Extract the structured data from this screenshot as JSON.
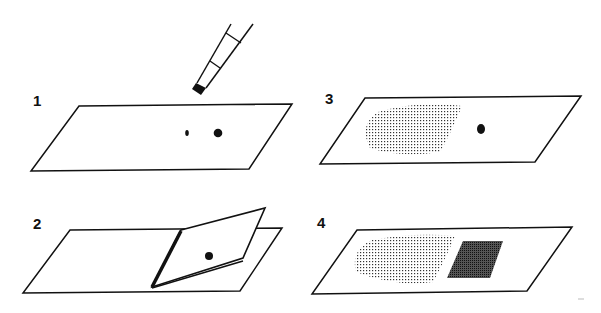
{
  "figure": {
    "panels": [
      {
        "label": "1",
        "description": "Slide with two drops; pipette applying"
      },
      {
        "label": "2",
        "description": "Coverslip placed over drop"
      },
      {
        "label": "3",
        "description": "Stippled smear area with a drop"
      },
      {
        "label": "4",
        "description": "Stippled smear area with dark hatched square"
      }
    ],
    "colors": {
      "ink": "#111111",
      "background": "#ffffff"
    }
  }
}
